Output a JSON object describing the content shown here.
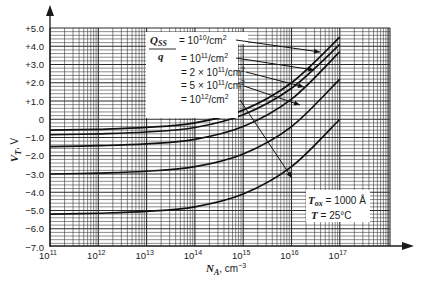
{
  "chart_data": {
    "type": "line",
    "title": "",
    "xlabel": "N_A, cm^-3",
    "ylabel": "V_T, V",
    "xscale": "log",
    "xlim": [
      100000000000.0,
      1e+17
    ],
    "ylim": [
      -7.0,
      5.0
    ],
    "grid": true,
    "x_tick_labels": [
      "10^11",
      "10^12",
      "10^13",
      "10^14",
      "10^15",
      "10^16",
      "10^17"
    ],
    "y_tick_labels": [
      "+5.0",
      "+4.0",
      "+3.0",
      "+2.0",
      "+1.0",
      "0",
      "-1.0",
      "-2.0",
      "-3.0",
      "-4.0",
      "-5.0",
      "-6.0",
      "-7.0"
    ],
    "x": [
      100000000000.0,
      1000000000000.0,
      10000000000000.0,
      100000000000000.0,
      1000000000000000.0,
      1e+16,
      1e+17
    ],
    "series": [
      {
        "name": "Qss/q = 10^10/cm^2",
        "values": [
          -0.6,
          -0.55,
          -0.45,
          -0.2,
          0.5,
          2.0,
          4.5
        ]
      },
      {
        "name": "Qss/q = 10^11/cm^2",
        "values": [
          -0.85,
          -0.8,
          -0.7,
          -0.45,
          0.25,
          1.7,
          4.1
        ]
      },
      {
        "name": "Qss/q = 2 x 10^11/cm^2",
        "values": [
          -1.5,
          -1.45,
          -1.35,
          -1.1,
          -0.4,
          1.1,
          3.7
        ]
      },
      {
        "name": "Qss/q = 5 x 10^11/cm^2",
        "values": [
          -3.0,
          -2.95,
          -2.85,
          -2.6,
          -1.9,
          -0.4,
          2.2
        ]
      },
      {
        "name": "Qss/q = 10^12/cm^2",
        "values": [
          -5.2,
          -5.15,
          -5.05,
          -4.8,
          -4.1,
          -2.6,
          0.0
        ]
      }
    ],
    "legend": {
      "prefix": "Q_SS / q",
      "entries": [
        "= 10^10/cm^2",
        "= 10^11/cm^2",
        "= 2 × 10^11/cm^2",
        "= 5 × 10^11/cm^2",
        "= 10^12/cm^2"
      ],
      "position": "upper-center, with arrows pointing to curves"
    },
    "annotations": [
      "T_ox = 1000 Å",
      "T = 25°C"
    ]
  },
  "labels": {
    "y_axis": {
      "main": "V",
      "sub": "T",
      "unit": ", V"
    },
    "x_axis": {
      "main": "N",
      "sub": "A",
      "unit": ", cm",
      "exp": "−3"
    },
    "legend_q": "Q",
    "legend_ss": "SS",
    "legend_den": "q",
    "legend_entries": [
      {
        "pre": "= 10",
        "exp": "10",
        "post": "/cm",
        "exp2": "2"
      },
      {
        "pre": "= 10",
        "exp": "11",
        "post": "/cm",
        "exp2": "2"
      },
      {
        "pre": "= 2 × 10",
        "exp": "11",
        "post": "/cm",
        "exp2": "2"
      },
      {
        "pre": "= 5 × 10",
        "exp": "11",
        "post": "/cm",
        "exp2": "2"
      },
      {
        "pre": "= 10",
        "exp": "12",
        "post": "/cm",
        "exp2": "2"
      }
    ],
    "tox_name": "T",
    "tox_sub": "ox",
    "tox_val": " = 1000 Å",
    "temp_name": "T",
    "temp_val": " = 25°C",
    "x_ticks": [
      {
        "base": "10",
        "exp": "11"
      },
      {
        "base": "10",
        "exp": "12"
      },
      {
        "base": "10",
        "exp": "13"
      },
      {
        "base": "10",
        "exp": "14"
      },
      {
        "base": "10",
        "exp": "15"
      },
      {
        "base": "10",
        "exp": "16"
      },
      {
        "base": "10",
        "exp": "17"
      }
    ],
    "y_ticks": [
      "+5.0",
      "+4.0",
      "+3.0",
      "+2.0",
      "+1.0",
      "0",
      "−1.0",
      "−2.0",
      "−3.0",
      "−4.0",
      "−5.0",
      "−6.0",
      "−7.0"
    ]
  },
  "colors": {
    "ink": "#1a1a1a",
    "grid": "#2a2a2a",
    "background": "#ffffff"
  }
}
